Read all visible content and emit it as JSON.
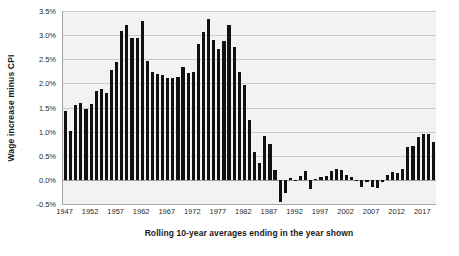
{
  "chart_data": {
    "type": "bar",
    "title": "",
    "xlabel": "Rolling 10-year averages ending in the year shown",
    "ylabel": "Wage increase minus CPI",
    "ylim": [
      -0.5,
      3.5
    ],
    "ytick_labels": [
      "3.5%",
      "3.0%",
      "2.5%",
      "2.0%",
      "1.5%",
      "1.0%",
      "0.5%",
      "0.0%",
      "-0.5%"
    ],
    "ytick_values": [
      3.5,
      3.0,
      2.5,
      2.0,
      1.5,
      1.0,
      0.5,
      0.0,
      -0.5
    ],
    "xtick_labels": [
      "1947",
      "1952",
      "1957",
      "1962",
      "1967",
      "1972",
      "1977",
      "1982",
      "1987",
      "1992",
      "1997",
      "2002",
      "2007",
      "2012",
      "2017"
    ],
    "xtick_values": [
      1947,
      1952,
      1957,
      1962,
      1967,
      1972,
      1977,
      1982,
      1987,
      1992,
      1997,
      2002,
      2007,
      2012,
      2017
    ],
    "grid": true,
    "legend": null,
    "units": "percent",
    "bar_color": "#111111",
    "plot_background": "#f2f2f2",
    "gridline_color": "#c9c9c9",
    "categories": [
      1947,
      1948,
      1949,
      1950,
      1951,
      1952,
      1953,
      1954,
      1955,
      1956,
      1957,
      1958,
      1959,
      1960,
      1961,
      1962,
      1963,
      1964,
      1965,
      1966,
      1967,
      1968,
      1969,
      1970,
      1971,
      1972,
      1973,
      1974,
      1975,
      1976,
      1977,
      1978,
      1979,
      1980,
      1981,
      1982,
      1983,
      1984,
      1985,
      1986,
      1987,
      1988,
      1989,
      1990,
      1991,
      1992,
      1993,
      1994,
      1995,
      1996,
      1997,
      1998,
      1999,
      2000,
      2001,
      2002,
      2003,
      2004,
      2005,
      2006,
      2007,
      2008,
      2009,
      2010,
      2011,
      2012,
      2013,
      2014,
      2015,
      2016,
      2017,
      2018,
      2019
    ],
    "values": [
      1.42,
      1.02,
      1.56,
      1.6,
      1.46,
      1.58,
      1.85,
      1.89,
      1.81,
      2.28,
      2.45,
      3.09,
      3.22,
      2.95,
      2.94,
      3.3,
      2.46,
      2.23,
      2.2,
      2.17,
      2.11,
      2.12,
      2.13,
      2.33,
      2.22,
      2.24,
      2.81,
      3.07,
      3.34,
      2.89,
      2.72,
      2.87,
      3.2,
      2.76,
      2.24,
      1.97,
      1.24,
      0.57,
      0.35,
      0.9,
      0.75,
      0.21,
      -0.46,
      -0.27,
      0.03,
      -0.03,
      0.08,
      0.18,
      -0.18,
      0.02,
      0.05,
      0.09,
      0.19,
      0.22,
      0.21,
      0.11,
      0.06,
      -0.02,
      -0.15,
      -0.04,
      -0.15,
      -0.16,
      -0.04,
      0.1,
      0.16,
      0.14,
      0.22,
      0.69,
      0.7,
      0.88,
      0.96,
      0.95,
      0.78
    ]
  },
  "axes": {
    "y_title": "Wage increase minus CPI",
    "x_title": "Rolling 10-year averages ending in the year shown"
  }
}
